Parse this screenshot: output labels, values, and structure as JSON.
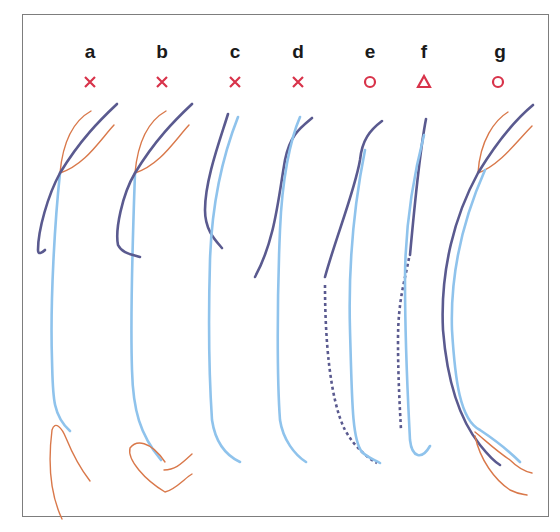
{
  "figure": {
    "panels": [
      {
        "label": "a",
        "marker": "cross",
        "marker_meaning": "x"
      },
      {
        "label": "b",
        "marker": "cross",
        "marker_meaning": "x"
      },
      {
        "label": "c",
        "marker": "cross",
        "marker_meaning": "x"
      },
      {
        "label": "d",
        "marker": "cross",
        "marker_meaning": "x"
      },
      {
        "label": "e",
        "marker": "circle",
        "marker_meaning": "o"
      },
      {
        "label": "f",
        "marker": "triangle",
        "marker_meaning": "triangle"
      },
      {
        "label": "g",
        "marker": "circle",
        "marker_meaning": "o"
      }
    ],
    "colors": {
      "marker": "#d8334a",
      "orange_curve": "#d9784a",
      "light_blue_curve": "#8fc3ec",
      "navy_curve": "#5a5a8f",
      "frame": "#7d7d7d",
      "label": "#1a1a1a"
    }
  }
}
